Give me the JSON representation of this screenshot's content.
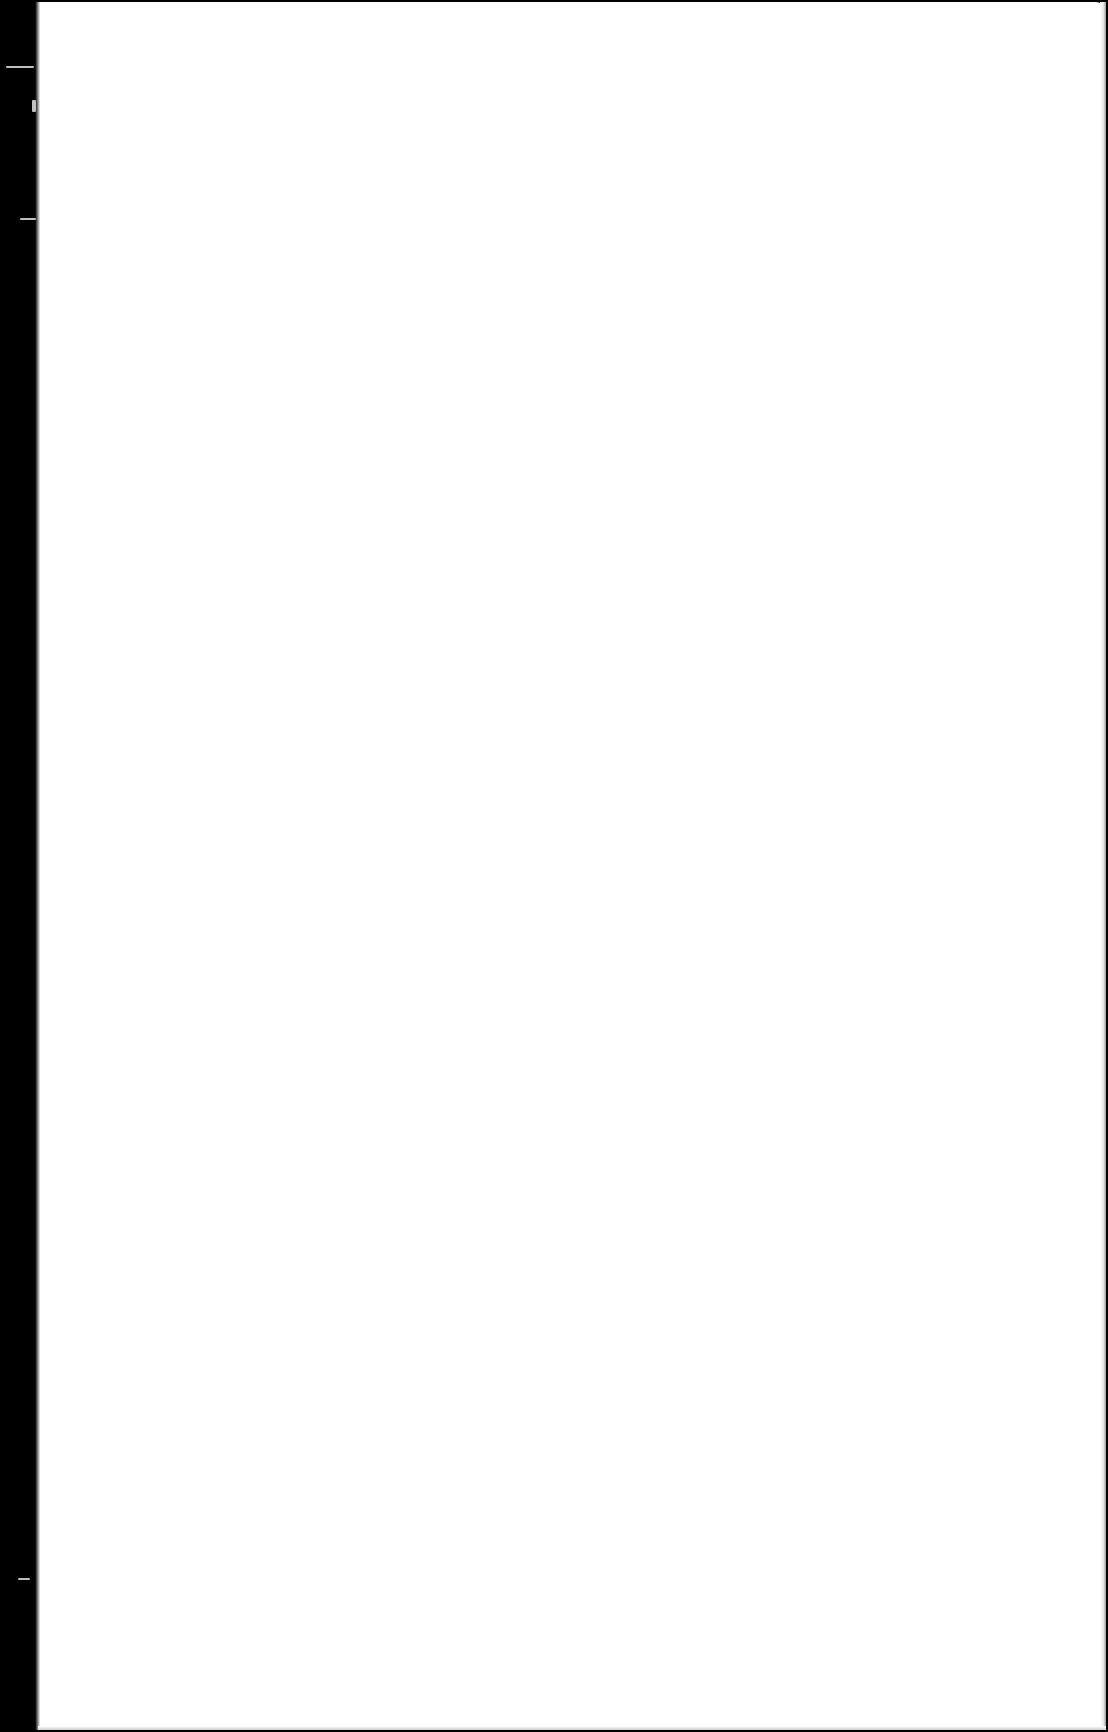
{
  "document": {
    "type": "scanned-page",
    "content": "",
    "colors": {
      "page": "#ffffff",
      "scan_background": "#000000",
      "edge_shadow": "#9a9a9a"
    }
  }
}
